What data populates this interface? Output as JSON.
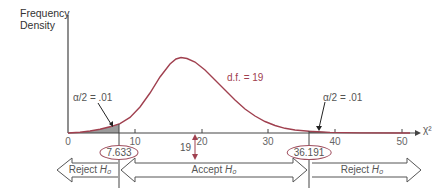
{
  "y_axis_label_line1": "Frequency",
  "y_axis_label_line2": "Density",
  "x_axis_label": "χ²",
  "df_label": "d.f. = 19",
  "alpha_left_label": "α/2 = .01",
  "alpha_right_label": "α/2  =  .01",
  "critical_left": "7.633",
  "critical_right": "36.191",
  "mean_label": "19",
  "regions": {
    "left": {
      "text": "Reject",
      "hyp": "H₀"
    },
    "middle": {
      "text": "Accept",
      "hyp": "H₀"
    },
    "right": {
      "text": "Reject",
      "hyp": "H₀"
    }
  },
  "ticks": [
    "0",
    "10",
    "20",
    "30",
    "40",
    "50"
  ],
  "colors": {
    "curve": "#a0404f",
    "axis": "#444444",
    "shade": "#9a9a9a"
  }
}
